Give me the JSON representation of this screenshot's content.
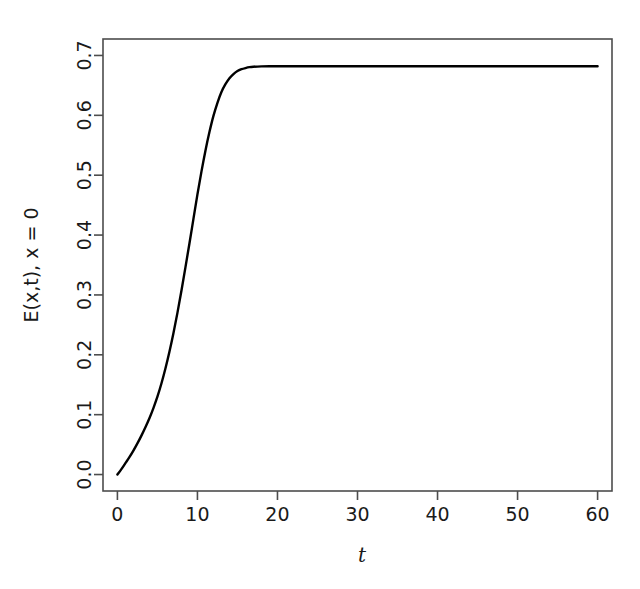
{
  "chart_data": {
    "type": "line",
    "title": "",
    "subtitle": "",
    "xlabel": "t",
    "ylabel": "E(x,t), x = 0",
    "xlim": [
      -1.8,
      61.8
    ],
    "ylim": [
      -0.0275,
      0.7275
    ],
    "xticks": [
      0,
      10,
      20,
      30,
      40,
      50,
      60
    ],
    "xtick_labels": [
      "0",
      "10",
      "20",
      "30",
      "40",
      "50",
      "60"
    ],
    "yticks": [
      0.0,
      0.1,
      0.2,
      0.3,
      0.4,
      0.5,
      0.6,
      0.7
    ],
    "ytick_labels": [
      "0.0",
      "0.1",
      "0.2",
      "0.3",
      "0.4",
      "0.5",
      "0.6",
      "0.7"
    ],
    "grid": false,
    "legend": false,
    "box": true,
    "line_color": "#000000",
    "line_width": 2.4,
    "plateau_value": 0.682,
    "series": [
      {
        "name": "E(x,t) at x = 0",
        "x": [
          0,
          0.5,
          1,
          1.5,
          2,
          2.5,
          3,
          3.5,
          4,
          4.5,
          5,
          5.5,
          6,
          6.5,
          7,
          7.5,
          8,
          8.5,
          9,
          9.5,
          10,
          10.5,
          11,
          11.5,
          12,
          12.5,
          13,
          13.5,
          14,
          14.5,
          15,
          15.5,
          16,
          16.5,
          17,
          18,
          19,
          20,
          22,
          24,
          26,
          28,
          30,
          34,
          38,
          42,
          46,
          50,
          54,
          58,
          60
        ],
        "y": [
          0.0,
          0.009,
          0.019,
          0.029,
          0.04,
          0.052,
          0.065,
          0.079,
          0.094,
          0.111,
          0.13,
          0.152,
          0.177,
          0.205,
          0.236,
          0.27,
          0.307,
          0.346,
          0.386,
          0.427,
          0.468,
          0.506,
          0.541,
          0.572,
          0.599,
          0.621,
          0.639,
          0.652,
          0.662,
          0.669,
          0.674,
          0.677,
          0.679,
          0.6805,
          0.6812,
          0.6818,
          0.682,
          0.682,
          0.682,
          0.682,
          0.682,
          0.682,
          0.682,
          0.682,
          0.682,
          0.682,
          0.682,
          0.682,
          0.682,
          0.682,
          0.682
        ]
      }
    ]
  },
  "axes": {
    "y_axis_title": "E(x,t), x = 0",
    "x_axis_title": "t"
  }
}
